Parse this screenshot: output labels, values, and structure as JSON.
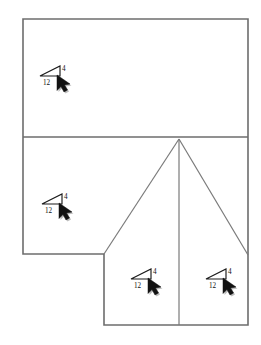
{
  "diagram": {
    "type": "roof-framing-plan",
    "line_color": "#6d6d6d",
    "ridge_color": "#7a7a7a",
    "text_color": "#111111",
    "background": "#ffffff",
    "arrow_color": "#121212"
  },
  "slope_markers": [
    {
      "id": "upper-section",
      "rise": "4",
      "run": "12",
      "pitch": "4:12",
      "triangle": {
        "x": 40,
        "y": 66,
        "w": 20,
        "h": 10
      },
      "rise_label_pos": {
        "x": 62,
        "y": 70
      },
      "run_label_pos": {
        "x": 44,
        "y": 84
      },
      "arrow_pos": {
        "x": 60,
        "y": 78
      }
    },
    {
      "id": "middle-left-section",
      "rise": "4",
      "run": "12",
      "pitch": "4:12",
      "triangle": {
        "x": 42,
        "y": 194,
        "w": 20,
        "h": 10
      },
      "rise_label_pos": {
        "x": 64,
        "y": 198
      },
      "run_label_pos": {
        "x": 46,
        "y": 212
      },
      "arrow_pos": {
        "x": 62,
        "y": 206
      }
    },
    {
      "id": "lower-left-section",
      "rise": "4",
      "run": "12",
      "pitch": "4:12",
      "triangle": {
        "x": 131,
        "y": 269,
        "w": 20,
        "h": 10
      },
      "rise_label_pos": {
        "x": 153,
        "y": 273
      },
      "run_label_pos": {
        "x": 135,
        "y": 287
      },
      "arrow_pos": {
        "x": 151,
        "y": 281
      }
    },
    {
      "id": "lower-right-section",
      "rise": "4",
      "run": "12",
      "pitch": "4:12",
      "triangle": {
        "x": 206,
        "y": 269,
        "w": 20,
        "h": 10
      },
      "rise_label_pos": {
        "x": 228,
        "y": 273
      },
      "run_label_pos": {
        "x": 210,
        "y": 287
      },
      "arrow_pos": {
        "x": 226,
        "y": 281
      }
    }
  ],
  "geometry": {
    "outline_points": "23,19 248,19 248,325 104,325 104,254 23,254",
    "eave_divider": "23,137 248,137",
    "step_edge": "104,254 179,254",
    "hip_peak": {
      "x": 179,
      "y": 139
    },
    "hip_left_ridge": "179,139 104,254",
    "hip_center_ridge": "179,139 179,325",
    "hip_right_ridge": "179,139 248,255"
  }
}
